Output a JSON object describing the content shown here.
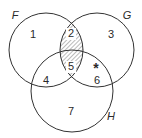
{
  "diagram": {
    "type": "venn-3-set",
    "sets": [
      {
        "name": "F",
        "label_pos": [
          15,
          19
        ]
      },
      {
        "name": "G",
        "label_pos": [
          127,
          19
        ]
      },
      {
        "name": "H",
        "label_pos": [
          111,
          120
        ]
      }
    ],
    "regions": [
      {
        "id": "1",
        "label": "1",
        "pos": [
          33,
          38
        ]
      },
      {
        "id": "2",
        "label": "2",
        "pos": [
          71,
          37
        ]
      },
      {
        "id": "3",
        "label": "3",
        "pos": [
          111,
          38
        ]
      },
      {
        "id": "4",
        "label": "4",
        "pos": [
          46,
          84
        ]
      },
      {
        "id": "5",
        "label": "5",
        "pos": [
          71,
          70
        ]
      },
      {
        "id": "6",
        "label": "6",
        "pos": [
          97,
          84
        ]
      },
      {
        "id": "7",
        "label": "7",
        "pos": [
          71,
          115
        ]
      }
    ],
    "marker": {
      "symbol": "*",
      "pos": [
        96,
        72
      ]
    },
    "shaded": "F ∩ G (regions 2 and 5)",
    "colors": {
      "stroke": "#333333",
      "hatch": "#555555",
      "background": "#ffffff"
    }
  }
}
